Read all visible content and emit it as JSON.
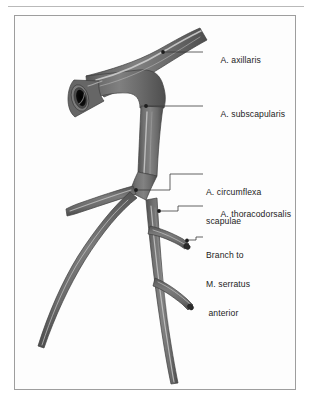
{
  "figure": {
    "background_color": "#fdfdfd",
    "frame_color": "#9e9e9e",
    "vessel_color": "#6f6f6f",
    "vessel_shadow_color": "#4a4a4a",
    "vessel_highlight_color": "#c9c9c9",
    "lumen_color": "#111111",
    "leader_color": "#3a3a3a",
    "text_color": "#232323"
  },
  "labels": [
    {
      "id": "axillaris",
      "text": "A. axillaris",
      "lines": [
        "A. axillaris"
      ],
      "leader": {
        "dot_x": 163,
        "dot_y": 52,
        "end_x": 203,
        "end_y": 52
      }
    },
    {
      "id": "subscapularis",
      "text": "A. subscapularis",
      "lines": [
        "A. subscapularis"
      ],
      "leader": {
        "dot_x": 146,
        "dot_y": 106,
        "end_x": 203,
        "end_y": 106
      }
    },
    {
      "id": "circumflexa-scapulae",
      "text": "A. circumflexa scapulae",
      "lines": [
        "A. circumflexa",
        "scapulae"
      ],
      "leader": {
        "dot_x": 136,
        "dot_y": 190,
        "end_x": 203,
        "end_y": 174
      }
    },
    {
      "id": "thoracodorsalis",
      "text": "A. thoracodorsalis",
      "lines": [
        "A. thoracodorsalis"
      ],
      "leader": {
        "dot_x": 159,
        "dot_y": 211,
        "end_x": 203,
        "end_y": 206
      }
    },
    {
      "id": "branch-to-m-serratus-anterior",
      "text": "Branch to M. serratus anterior",
      "lines": [
        "Branch to",
        "M. serratus",
        " anterior"
      ],
      "leader": {
        "dot_x": 187,
        "dot_y": 240,
        "end_x": 203,
        "end_y": 237
      }
    }
  ],
  "vessels": [
    {
      "id": "a-axillaris",
      "name": "A. axillaris",
      "description": "main trunk arcing from cut proximal end at left to upper right"
    },
    {
      "id": "a-subscapularis",
      "name": "A. subscapularis",
      "description": "descends from axillary trunk"
    },
    {
      "id": "a-circumflexa-scapulae",
      "name": "A. circumflexa scapulae",
      "description": "branches to the left, with short stub and long descending limb"
    },
    {
      "id": "a-thoracodorsalis",
      "name": "A. thoracodorsalis",
      "description": "continues inferiorly to bottom of plate"
    },
    {
      "id": "branch-serratus-upper",
      "name": "Branch to M. serratus anterior (upper)",
      "description": "short branch to the right"
    },
    {
      "id": "branch-serratus-lower",
      "name": "Branch to M. serratus anterior (lower)",
      "description": "second short branch to the right"
    }
  ],
  "cut_end": {
    "id": "vessel-cut-end",
    "description": "open proximal stump of A. axillaris showing dark lumen"
  }
}
